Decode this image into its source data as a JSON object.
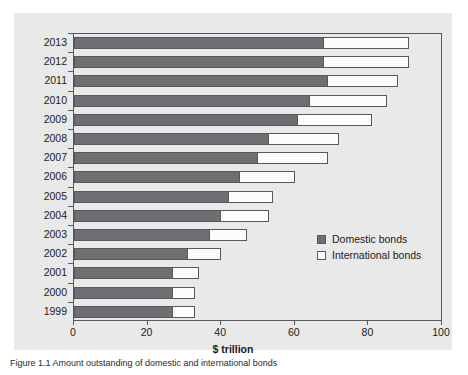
{
  "chart_data": {
    "type": "bar",
    "orientation": "horizontal",
    "stacked": true,
    "title": "",
    "xlabel": "$ trillion",
    "ylabel": "",
    "xlim": [
      0,
      100
    ],
    "xticks": [
      0,
      20,
      40,
      60,
      80,
      100
    ],
    "grid": false,
    "legend_position": "inside-right",
    "categories": [
      "2013",
      "2012",
      "2011",
      "2010",
      "2009",
      "2008",
      "2007",
      "2006",
      "2005",
      "2004",
      "2003",
      "2002",
      "2001",
      "2000",
      "1999"
    ],
    "series": [
      {
        "name": "Domestic bonds",
        "color": "#6e6f72",
        "values": [
          68,
          68,
          69,
          64,
          61,
          53,
          50,
          45,
          42,
          40,
          37,
          31,
          27,
          27,
          27
        ]
      },
      {
        "name": "International bonds",
        "color": "#fcfcfc",
        "values": [
          23,
          23,
          19,
          21,
          20,
          19,
          19,
          15,
          12,
          13,
          10,
          9,
          7,
          6,
          6
        ]
      }
    ],
    "totals": [
      91,
      91,
      88,
      85,
      81,
      72,
      69,
      60,
      54,
      53,
      47,
      40,
      34,
      33,
      33
    ]
  },
  "axis": {
    "x_title": "$ trillion",
    "x_tick_labels": [
      "0",
      "20",
      "40",
      "60",
      "80",
      "100"
    ],
    "y_tick_labels": [
      "2013",
      "2012",
      "2011",
      "2010",
      "2009",
      "2008",
      "2007",
      "2006",
      "2005",
      "2004",
      "2003",
      "2002",
      "2001",
      "2000",
      "1999"
    ]
  },
  "legend": {
    "items": [
      {
        "label": "Domestic bonds",
        "swatch": "filled-gray-swatch"
      },
      {
        "label": "International bonds",
        "swatch": "outlined-white-swatch"
      }
    ]
  },
  "caption": {
    "label": "Figure 1.1",
    "text": "Figure 1.1  Amount outstanding of domestic and international bonds"
  },
  "colors": {
    "panel_background": "#e9e9e9",
    "axis_line": "#58585a",
    "domestic": "#6e6f72",
    "international": "#fcfcfc",
    "text": "#1b1b1b"
  }
}
